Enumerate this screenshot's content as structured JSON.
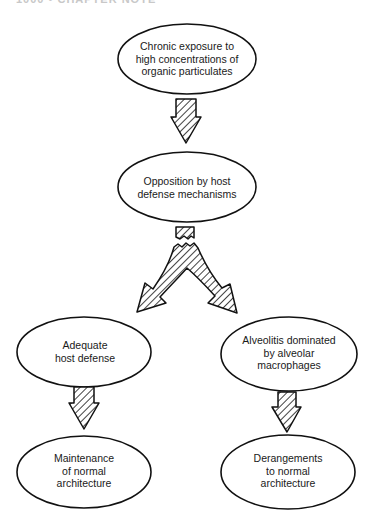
{
  "page_header": "1000 • CHAPTER NOTE",
  "diagram": {
    "nodes": [
      {
        "id": "exposure",
        "lines": [
          "Chronic exposure to",
          "high concentrations of",
          "organic particulates"
        ],
        "cx": 187,
        "cy": 59,
        "rx": 69,
        "ry": 35
      },
      {
        "id": "opposition",
        "lines": [
          "Opposition by host",
          "defense mechanisms"
        ],
        "cx": 187,
        "cy": 187,
        "rx": 69,
        "ry": 35
      },
      {
        "id": "adequate",
        "lines": [
          "Adequate",
          "host defense"
        ],
        "cx": 84,
        "cy": 352,
        "rx": 67,
        "ry": 35
      },
      {
        "id": "alveolitis",
        "lines": [
          "Alveolitis dominated",
          "by alveolar",
          "macrophages"
        ],
        "cx": 289,
        "cy": 354,
        "rx": 68,
        "ry": 37
      },
      {
        "id": "maintenance",
        "lines": [
          "Maintenance",
          "of normal",
          "architecture"
        ],
        "cx": 84,
        "cy": 472,
        "rx": 67,
        "ry": 36
      },
      {
        "id": "derangements",
        "lines": [
          "Derangements",
          "to normal",
          "architecture"
        ],
        "cx": 288,
        "cy": 472,
        "rx": 67,
        "ry": 37
      }
    ],
    "edges": [
      {
        "from": "exposure",
        "to": "opposition",
        "style": "hatched-arrow"
      },
      {
        "from": "opposition",
        "to": "adequate",
        "style": "hatched-split-arrow"
      },
      {
        "from": "opposition",
        "to": "alveolitis",
        "style": "hatched-split-arrow"
      },
      {
        "from": "adequate",
        "to": "maintenance",
        "style": "hatched-arrow"
      },
      {
        "from": "alveolitis",
        "to": "derangements",
        "style": "hatched-arrow"
      }
    ],
    "colors": {
      "stroke": "#111111",
      "fill": "#ffffff",
      "text": "#1a1a1a"
    }
  },
  "labels": {
    "exposure": "Chronic exposure to\nhigh concentrations of\norganic particulates",
    "exposure_l1": "Chronic exposure to",
    "exposure_l2": "high concentrations of",
    "exposure_l3": "organic particulates",
    "opposition_l1": "Opposition by host",
    "opposition_l2": "defense mechanisms",
    "adequate_l1": "Adequate",
    "adequate_l2": "host defense",
    "alveolitis_l1": "Alveolitis dominated",
    "alveolitis_l2": "by alveolar",
    "alveolitis_l3": "macrophages",
    "maintenance_l1": "Maintenance",
    "maintenance_l2": "of normal",
    "maintenance_l3": "architecture",
    "derangements_l1": "Derangements",
    "derangements_l2": "to normal",
    "derangements_l3": "architecture"
  }
}
